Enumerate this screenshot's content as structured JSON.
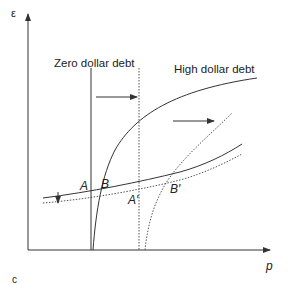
{
  "diagram": {
    "axes": {
      "y_label": "ε",
      "x_label": "p"
    },
    "curves": [
      {
        "name": "zero-dollar-debt-line",
        "label": "Zero dollar debt",
        "style": "solid"
      },
      {
        "name": "zero-dollar-debt-line-shifted",
        "label": "",
        "style": "dotted"
      },
      {
        "name": "high-dollar-debt-curve",
        "label": "High dollar debt",
        "style": "solid"
      },
      {
        "name": "high-dollar-debt-curve-shifted",
        "label": "",
        "style": "dotted"
      },
      {
        "name": "upward-sloping-curve",
        "label": "",
        "style": "solid"
      },
      {
        "name": "upward-sloping-curve-shifted",
        "label": "",
        "style": "dotted"
      }
    ],
    "points": {
      "a": "A",
      "b": "B",
      "a_prime": "A′",
      "b_prime": "B′"
    },
    "panel_label": "c",
    "colors": {
      "line": "#333333",
      "text": "#222222",
      "background": "#ffffff"
    }
  }
}
